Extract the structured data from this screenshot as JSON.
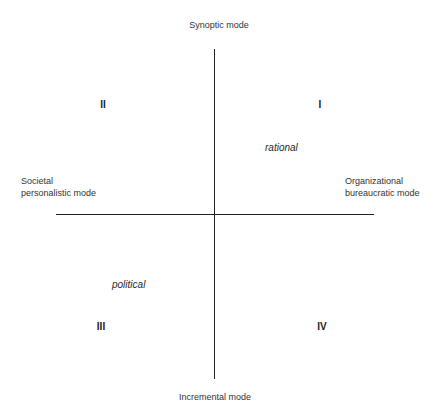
{
  "diagram": {
    "axes": {
      "top": "Synoptic mode",
      "bottom": "Incremental mode",
      "left": [
        "Societal",
        "personalistic mode"
      ],
      "right": [
        "Organizational",
        "bureaucratic mode"
      ]
    },
    "quadrants": {
      "q1": "I",
      "q2": "II",
      "q3": "III",
      "q4": "IV"
    },
    "annotations": {
      "rational": "rational",
      "political": "political"
    }
  }
}
